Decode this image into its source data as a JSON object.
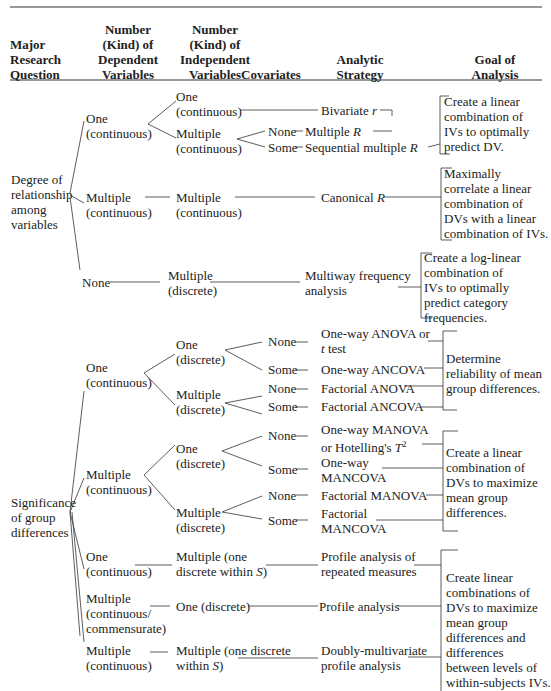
{
  "header": {
    "col1": [
      "Major",
      "Research",
      "Question"
    ],
    "col2": [
      "Number",
      "(Kind) of",
      "Dependent",
      "Variables"
    ],
    "col3": [
      "Number",
      "(Kind) of",
      "Independent",
      "Variables"
    ],
    "col4": [
      "Covariates"
    ],
    "col5": [
      "Analytic",
      "Strategy"
    ],
    "col6": [
      "Goal of",
      "Analysis"
    ]
  },
  "relationship": {
    "question": [
      "Degree of",
      "relationship",
      "among",
      "variables"
    ],
    "dv_one_cont": [
      "One",
      "(continuous)"
    ],
    "iv_one_cont": [
      "One",
      "(continuous)"
    ],
    "iv_mult_cont": [
      "Multiple",
      "(continuous)"
    ],
    "cov_none": "None",
    "cov_some": "Some",
    "bivariate": "Bivariate r",
    "multiple_r": "Multiple R",
    "seq_multiple_r": "Sequential multiple R",
    "goal1": [
      "Create a linear",
      "combination of",
      "IVs to optimally",
      "predict DV."
    ],
    "dv_mult_cont": [
      "Multiple",
      "(continuous)"
    ],
    "iv_mult_cont2": [
      "Multiple",
      "(continuous)"
    ],
    "canonical": "Canonical R",
    "goal2": [
      "Maximally",
      "correlate a linear",
      "combination of",
      "DVs with a linear",
      "combination of IVs."
    ],
    "dv_none": "None",
    "iv_mult_disc": [
      "Multiple",
      "(discrete)"
    ],
    "multiway": [
      "Multiway frequency",
      "analysis"
    ],
    "goal3": [
      "Create a log-linear",
      "combination of",
      "IVs to optimally",
      "predict category",
      "frequencies."
    ]
  },
  "significance": {
    "question": [
      "Significance",
      "of group",
      "differences"
    ],
    "dv_one_cont": [
      "One",
      "(continuous)"
    ],
    "iv_one_disc": [
      "One",
      "(discrete)"
    ],
    "iv_mult_disc": [
      "Multiple",
      "(discrete)"
    ],
    "cov_none": "None",
    "cov_some": "Some",
    "anova": [
      "One-way ANOVA or",
      "t test"
    ],
    "ancova": "One-way ANCOVA",
    "fanova": "Factorial ANOVA",
    "fancova": "Factorial ANCOVA",
    "goal4": [
      "Determine",
      "reliability of mean",
      "group differences."
    ],
    "dv_mult_cont": [
      "Multiple",
      "(continuous)"
    ],
    "manova": [
      "One-way MANOVA",
      "or Hotelling's T²"
    ],
    "mancova": [
      "One-way",
      "MANCOVA"
    ],
    "fmanova": "Factorial MANOVA",
    "fmancova": [
      "Factorial",
      "MANCOVA"
    ],
    "goal5": [
      "Create a linear",
      "combination of",
      "DVs to maximize",
      "mean group",
      "differences."
    ],
    "dv_one_cont2": [
      "One",
      "(continuous)"
    ],
    "iv_mult_within": [
      "Multiple (one",
      "discrete within S)"
    ],
    "profile_rm": [
      "Profile analysis of",
      "repeated measures"
    ],
    "dv_mult_commens": [
      "Multiple",
      "(continuous/",
      "commensurate)"
    ],
    "iv_one_disc2": "One (discrete)",
    "profile": "Profile analysis",
    "dv_mult_cont2": [
      "Multiple",
      "(continuous)"
    ],
    "iv_mult_within2": [
      "Multiple (one discrete",
      "within S)"
    ],
    "doubly": [
      "Doubly-multivariate",
      "profile analysis"
    ],
    "goal6": [
      "Create linear",
      "combinations of",
      "DVs to maximize",
      "mean group",
      "differences and",
      "differences",
      "between levels of",
      "within-subjects IVs."
    ]
  }
}
